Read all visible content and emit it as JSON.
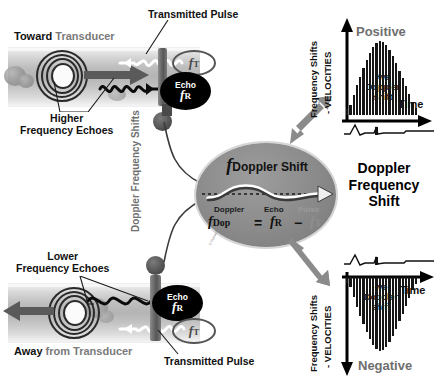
{
  "figure": {
    "title": "Doppler Frequency Shift",
    "copyright": "© Rumack MD"
  },
  "top_vessel": {
    "heading_bold": "Toward",
    "heading_rest": " Transducer",
    "echo_label": "Higher\nFrequency Echoes",
    "echo_line1": "Higher",
    "echo_line2": "Frequency Echoes",
    "pulse_label": "Transmitted Pulse",
    "echo_ellipse_top": "Echo",
    "echo_ellipse_f": "f",
    "echo_ellipse_sub": "R",
    "transmit_ellipse_f": "f",
    "transmit_ellipse_sub": "T"
  },
  "bottom_vessel": {
    "heading_bold": "Away",
    "heading_rest": " from Transducer",
    "echo_line1": "Lower",
    "echo_line2": "Frequency Echoes",
    "pulse_label": "Transmitted Pulse",
    "echo_ellipse_top": "Echo",
    "echo_ellipse_f": "f",
    "echo_ellipse_sub": "R",
    "transmit_ellipse_f": "f",
    "transmit_ellipse_sub": "T"
  },
  "connector": {
    "line1": "Doppler",
    "line2": "Frequency",
    "line3": "Shifts"
  },
  "center_ellipse": {
    "title_f": "f",
    "title_text": "Doppler Shift",
    "eq_label_doppler": "Doppler",
    "eq_label_echo": "Echo",
    "eq_label_pulse": "Pulse",
    "eq_f1": "f",
    "eq_f1_sub": "Dop",
    "eq_equals": "=",
    "eq_f2": "f",
    "eq_f2_sub": "R",
    "eq_minus": "−",
    "eq_f3": "f",
    "eq_f3_sub": "T"
  },
  "chart_positive": {
    "title": "Positive",
    "y_axis_line1": "Frequency Shifts",
    "y_axis_line2": "- VELOCITIES",
    "x_axis": "Time",
    "annot_line1": "+ve",
    "annot_line2": "Doppler",
    "annot_line3": "shift"
  },
  "chart_negative": {
    "title": "Negative",
    "y_axis_line1": "Frequency Shifts",
    "y_axis_line2": "- VELOCITIES",
    "x_axis": "Time",
    "annot_line1": "-ve",
    "annot_line2": "Doppler",
    "annot_line3": "shift"
  },
  "chart_data": [
    {
      "type": "bar",
      "name": "positive-doppler-spectrum",
      "title": "Positive",
      "xlabel": "Time",
      "ylabel": "Frequency Shifts - VELOCITIES",
      "direction": "up",
      "grid": false,
      "categories": [
        "t1",
        "t2",
        "t3",
        "t4",
        "t5",
        "t6",
        "t7",
        "t8",
        "t9",
        "t10",
        "t11",
        "t12",
        "t13",
        "t14",
        "t15",
        "t16",
        "t17",
        "t18",
        "t19",
        "t20",
        "t21",
        "t22"
      ],
      "values": [
        6,
        10,
        20,
        30,
        39,
        48,
        56,
        63,
        69,
        73,
        75,
        74,
        71,
        66,
        60,
        53,
        45,
        37,
        29,
        21,
        13,
        7
      ],
      "ylim": [
        0,
        80
      ],
      "annotation": "+ve Doppler shift",
      "ecg_present": true
    },
    {
      "type": "bar",
      "name": "negative-doppler-spectrum",
      "title": "Negative",
      "xlabel": "Time",
      "ylabel": "Frequency Shifts - VELOCITIES",
      "direction": "down",
      "grid": false,
      "categories": [
        "t1",
        "t2",
        "t3",
        "t4",
        "t5",
        "t6",
        "t7",
        "t8",
        "t9",
        "t10",
        "t11",
        "t12",
        "t13",
        "t14",
        "t15",
        "t16",
        "t17",
        "t18",
        "t19",
        "t20",
        "t21",
        "t22"
      ],
      "values": [
        -6,
        -10,
        -20,
        -30,
        -39,
        -48,
        -56,
        -63,
        -69,
        -73,
        -75,
        -74,
        -71,
        -66,
        -60,
        -53,
        -45,
        -37,
        -29,
        -21,
        -13,
        -7
      ],
      "ylim": [
        -80,
        0
      ],
      "annotation": "-ve Doppler shift",
      "ecg_present": true
    }
  ]
}
